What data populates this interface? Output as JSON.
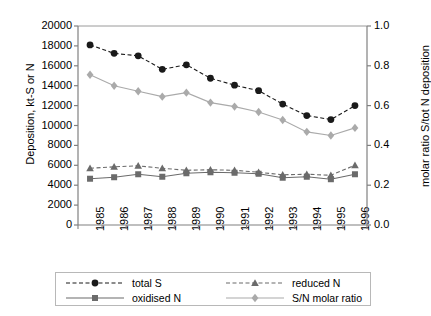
{
  "chart_data": {
    "type": "line",
    "title": "",
    "subtitle": "",
    "xlabel": "",
    "ylabel": "Deposition, kt-S or N",
    "y2label": "molar ratio S/tot N deposition",
    "categories": [
      "1985",
      "1986",
      "1987",
      "1988",
      "1989",
      "1990",
      "1991",
      "1992",
      "1993",
      "1994",
      "1995",
      "1996"
    ],
    "x": [
      1985,
      1986,
      1987,
      1988,
      1989,
      1990,
      1991,
      1992,
      1993,
      1994,
      1995,
      1996
    ],
    "ylim": [
      0,
      20000
    ],
    "yticks": [
      0,
      2000,
      4000,
      6000,
      8000,
      10000,
      12000,
      14000,
      16000,
      18000,
      20000
    ],
    "y2lim": [
      0.0,
      1.0
    ],
    "y2ticks": [
      "0.0",
      "0.2",
      "0.4",
      "0.6",
      "0.8",
      "1.0"
    ],
    "grid": false,
    "legend_position": "bottom",
    "series": [
      {
        "name": "total S",
        "axis": "left",
        "marker": "circle",
        "line": "dashed",
        "color": "#1a1a1a",
        "values": [
          18100,
          17250,
          17000,
          15650,
          16100,
          14750,
          14050,
          13500,
          12150,
          11000,
          10600,
          12000
        ]
      },
      {
        "name": "reduced N",
        "axis": "left",
        "marker": "triangle",
        "line": "dashed",
        "color": "#6b6b6b",
        "values": [
          5700,
          5850,
          5950,
          5700,
          5500,
          5550,
          5500,
          5300,
          5050,
          5100,
          5000,
          6000
        ]
      },
      {
        "name": "oxidised N",
        "axis": "left",
        "marker": "square",
        "line": "solid",
        "color": "#6b6b6b",
        "values": [
          4650,
          4800,
          5100,
          4850,
          5200,
          5300,
          5250,
          5150,
          4750,
          4850,
          4600,
          5100
        ]
      },
      {
        "name": "S/N molar ratio",
        "axis": "right",
        "marker": "diamond",
        "line": "solid",
        "color": "#aaaaaa",
        "values": [
          0.755,
          0.7,
          0.672,
          0.645,
          0.665,
          0.615,
          0.595,
          0.568,
          0.528,
          0.468,
          0.45,
          0.488
        ]
      }
    ]
  },
  "legend": {
    "entries": [
      {
        "label": "total S",
        "marker": "circle",
        "line": "dashed",
        "color": "#1a1a1a"
      },
      {
        "label": "reduced N",
        "marker": "triangle",
        "line": "dashed",
        "color": "#6b6b6b"
      },
      {
        "label": "oxidised N",
        "marker": "square",
        "line": "solid",
        "color": "#6b6b6b"
      },
      {
        "label": "S/N molar ratio",
        "marker": "diamond",
        "line": "solid",
        "color": "#aaaaaa"
      }
    ]
  },
  "colors": {
    "axis": "#808080",
    "text": "#000000",
    "legend_border": "#b8b8b8",
    "background": "#ffffff"
  }
}
